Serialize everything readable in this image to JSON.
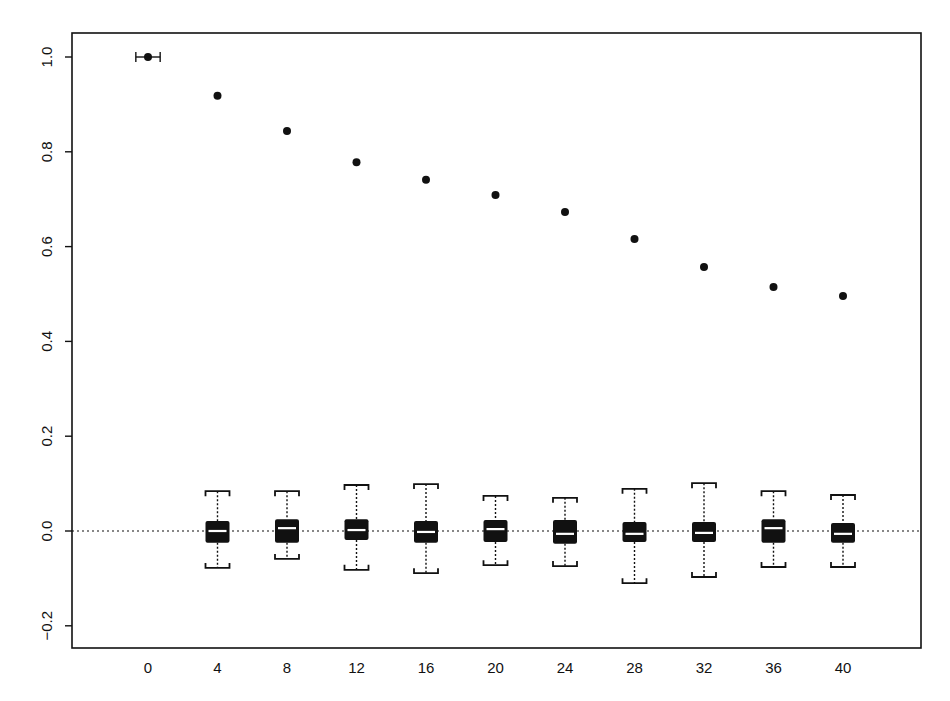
{
  "chart_data": {
    "type": "scatter+boxplot",
    "title": "",
    "xlabel": "",
    "ylabel": "",
    "xlim": [
      -4.3,
      44.8
    ],
    "ylim": [
      -0.24,
      1.05
    ],
    "grid": false,
    "legend": null,
    "x_ticks": [
      0,
      4,
      8,
      12,
      16,
      20,
      24,
      28,
      32,
      36,
      40
    ],
    "y_ticks": [
      -0.2,
      0.0,
      0.2,
      0.4,
      0.6,
      0.8,
      1.0
    ],
    "y_tick_labels": [
      "-0.2",
      "0.0",
      "0.2",
      "0.4",
      "0.6",
      "0.8",
      "1.0"
    ],
    "reference_line": {
      "y": 0.0,
      "style": "dotted"
    },
    "point_series": {
      "name": "points",
      "x": [
        0,
        4,
        8,
        12,
        16,
        20,
        24,
        28,
        32,
        36,
        40
      ],
      "y": [
        1.0,
        0.918,
        0.844,
        0.778,
        0.741,
        0.709,
        0.673,
        0.616,
        0.557,
        0.515,
        0.496
      ]
    },
    "error_bar_at_0": {
      "x": 0,
      "y": 1.0,
      "x_low": -0.7,
      "x_high": 0.7
    },
    "boxplots": [
      {
        "x": 4,
        "whisker_low": -0.078,
        "q1": -0.025,
        "median": 0.0,
        "q3": 0.021,
        "whisker_high": 0.084
      },
      {
        "x": 8,
        "whisker_low": -0.059,
        "q1": -0.025,
        "median": 0.006,
        "q3": 0.025,
        "whisker_high": 0.084
      },
      {
        "x": 12,
        "whisker_low": -0.082,
        "q1": -0.019,
        "median": 0.002,
        "q3": 0.025,
        "whisker_high": 0.097
      },
      {
        "x": 16,
        "whisker_low": -0.089,
        "q1": -0.025,
        "median": -0.002,
        "q3": 0.021,
        "whisker_high": 0.099
      },
      {
        "x": 20,
        "whisker_low": -0.072,
        "q1": -0.023,
        "median": 0.004,
        "q3": 0.023,
        "whisker_high": 0.074
      },
      {
        "x": 24,
        "whisker_low": -0.074,
        "q1": -0.027,
        "median": -0.006,
        "q3": 0.023,
        "whisker_high": 0.07
      },
      {
        "x": 28,
        "whisker_low": -0.11,
        "q1": -0.023,
        "median": -0.006,
        "q3": 0.019,
        "whisker_high": 0.089
      },
      {
        "x": 32,
        "whisker_low": -0.097,
        "q1": -0.023,
        "median": -0.004,
        "q3": 0.019,
        "whisker_high": 0.101
      },
      {
        "x": 36,
        "whisker_low": -0.076,
        "q1": -0.025,
        "median": 0.006,
        "q3": 0.025,
        "whisker_high": 0.084
      },
      {
        "x": 40,
        "whisker_low": -0.076,
        "q1": -0.025,
        "median": -0.006,
        "q3": 0.017,
        "whisker_high": 0.076
      }
    ]
  },
  "style": {
    "ink": "#111111",
    "background": "#ffffff",
    "median_color": "#ffffff"
  }
}
